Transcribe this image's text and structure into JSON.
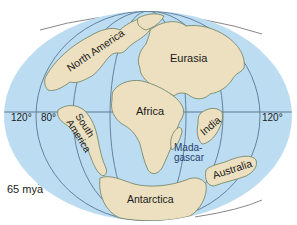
{
  "map": {
    "colors": {
      "ocean": "#bcdcf2",
      "land": "#ece0c0",
      "coast": "#7a8a6a",
      "grid": "#5a7890",
      "text": "#1a1a1a",
      "madagascar_label": "#1f3f6e"
    },
    "labels": {
      "north_america": "North America",
      "eurasia": "Eurasia",
      "africa": "Africa",
      "south_america_1": "South",
      "south_america_2": "America",
      "india": "India",
      "madagascar_1": "Mada-",
      "madagascar_2": "gascar",
      "australia": "Australia",
      "antarctica": "Antarctica"
    },
    "longitudes": {
      "left_120": "120°",
      "left_80": "80°",
      "right_120": "120°"
    },
    "caption": "65 mya"
  }
}
